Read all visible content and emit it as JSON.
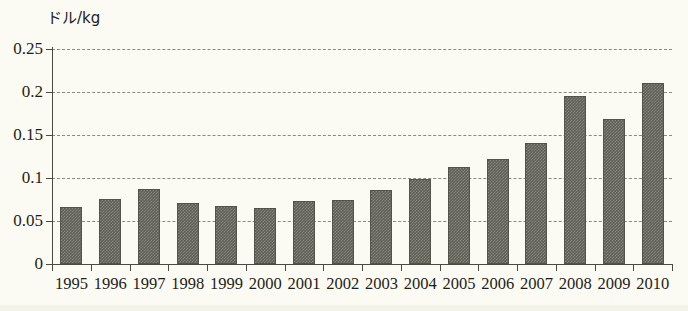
{
  "chart_data": {
    "type": "bar",
    "title": "",
    "subtitle": "",
    "xlabel": "",
    "ylabel": "ドル/kg",
    "categories": [
      "1995",
      "1996",
      "1997",
      "1998",
      "1999",
      "2000",
      "2001",
      "2002",
      "2003",
      "2004",
      "2005",
      "2006",
      "2007",
      "2008",
      "2009",
      "2010"
    ],
    "values": [
      0.066,
      0.076,
      0.087,
      0.071,
      0.068,
      0.065,
      0.073,
      0.075,
      0.086,
      0.099,
      0.113,
      0.122,
      0.141,
      0.195,
      0.169,
      0.21
    ],
    "series": [
      {
        "name": "価格",
        "values": [
          0.066,
          0.076,
          0.087,
          0.071,
          0.068,
          0.065,
          0.073,
          0.075,
          0.086,
          0.099,
          0.113,
          0.122,
          0.141,
          0.195,
          0.169,
          0.21
        ]
      }
    ],
    "ylim": [
      0,
      0.25
    ],
    "yticks": [
      0,
      0.05,
      0.1,
      0.15,
      0.2,
      0.25
    ],
    "ytick_labels": [
      "0",
      "0.05",
      "0.1",
      "0.15",
      "0.2",
      "0.25"
    ],
    "grid": true,
    "grid_axis": "y",
    "grid_style": "dashed",
    "legend": false,
    "legend_position": "none",
    "annotations": [],
    "colors": {
      "bar_fill": "#5e5e55",
      "bar_edge": "#53534b",
      "gridline": "#8a8a7e",
      "axis": "#4a4a42",
      "text": "#1d1d19",
      "background": "#fcfbf3"
    }
  }
}
